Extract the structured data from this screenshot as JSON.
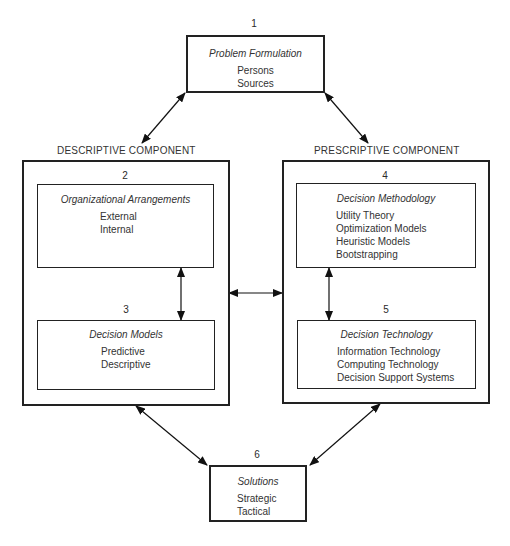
{
  "diagram": {
    "problem_formulation": {
      "number": "1",
      "title": "Problem Formulation",
      "items": [
        "Persons",
        "Sources"
      ]
    },
    "descriptive_component": {
      "label": "DESCRIPTIVE COMPONENT",
      "organizational_arrangements": {
        "number": "2",
        "title": "Organizational Arrangements",
        "items": [
          "External",
          "Internal"
        ]
      },
      "decision_models": {
        "number": "3",
        "title": "Decision Models",
        "items": [
          "Predictive",
          "Descriptive"
        ]
      }
    },
    "prescriptive_component": {
      "label": "PRESCRIPTIVE COMPONENT",
      "decision_methodology": {
        "number": "4",
        "title": "Decision Methodology",
        "items": [
          "Utility Theory",
          "Optimization Models",
          "Heuristic Models",
          "Bootstrapping"
        ]
      },
      "decision_technology": {
        "number": "5",
        "title": "Decision Technology",
        "items": [
          "Information Technology",
          "Computing Technology",
          "Decision Support Systems"
        ]
      }
    },
    "solutions": {
      "number": "6",
      "title": "Solutions",
      "items": [
        "Strategic",
        "Tactical"
      ]
    },
    "connections": [
      {
        "from": "1",
        "to": "DESCRIPTIVE COMPONENT",
        "type": "bidirectional"
      },
      {
        "from": "1",
        "to": "PRESCRIPTIVE COMPONENT",
        "type": "bidirectional"
      },
      {
        "from": "2",
        "to": "3",
        "type": "bidirectional"
      },
      {
        "from": "4",
        "to": "5",
        "type": "bidirectional"
      },
      {
        "from": "DESCRIPTIVE COMPONENT",
        "to": "PRESCRIPTIVE COMPONENT",
        "type": "bidirectional"
      },
      {
        "from": "DESCRIPTIVE COMPONENT",
        "to": "6",
        "type": "bidirectional"
      },
      {
        "from": "PRESCRIPTIVE COMPONENT",
        "to": "6",
        "type": "bidirectional"
      }
    ]
  }
}
